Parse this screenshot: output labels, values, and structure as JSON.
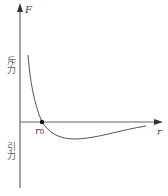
{
  "diagram": {
    "y_axis": {
      "label": "F"
    },
    "x_axis": {
      "label": "r"
    },
    "equilibrium_point": {
      "label_main": "r",
      "label_sub": "0"
    },
    "region_labels": {
      "repulsion": "斥力",
      "attraction": "引力"
    },
    "colors": {
      "axis": "#555555",
      "curve": "#555555",
      "point": "#111111",
      "text": "#666666"
    }
  }
}
